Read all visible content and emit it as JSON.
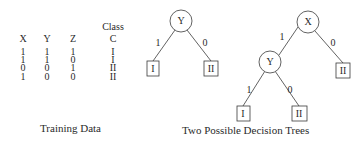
{
  "training_data": {
    "class_super_header": "Class",
    "headers": [
      "X",
      "Y",
      "Z",
      "C"
    ],
    "rows": [
      [
        "1",
        "1",
        "1",
        "I"
      ],
      [
        "1",
        "1",
        "0",
        "I"
      ],
      [
        "0",
        "0",
        "1",
        "II"
      ],
      [
        "1",
        "0",
        "0",
        "II"
      ]
    ],
    "caption": "Training Data"
  },
  "trees": {
    "caption": "Two Possible Decision Trees",
    "tree1": {
      "root": "Y",
      "edges": [
        {
          "label": "1",
          "leaf": "I"
        },
        {
          "label": "0",
          "leaf": "II"
        }
      ]
    },
    "tree2": {
      "root": "X",
      "edges": [
        {
          "label": "1",
          "child": "Y"
        },
        {
          "label": "0",
          "leaf": "II"
        }
      ],
      "child_y": {
        "node": "Y",
        "edges": [
          {
            "label": "1",
            "leaf": "I"
          },
          {
            "label": "0",
            "leaf": "II"
          }
        ]
      }
    }
  },
  "colors": {
    "ink": "#2a2a2a",
    "background": "#ffffff"
  }
}
